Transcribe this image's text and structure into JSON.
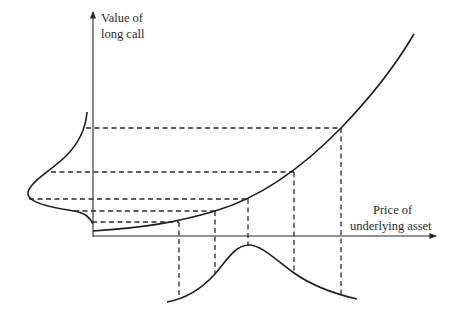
{
  "diagram": {
    "type": "option-payoff-distribution",
    "y_axis_label_line1": "Value of",
    "y_axis_label_line2": "long call",
    "x_axis_label_line1": "Price of",
    "x_axis_label_line2": "underlying asset",
    "elements": [
      "convex long call value curve",
      "bell-shaped distribution of underlying asset price below x-axis",
      "skewed distribution of long call value left of y-axis",
      "dashed mapping lines between curve points and both distributions"
    ],
    "mapped_points": [
      {
        "asset_price_px": 179,
        "call_value_px": 222
      },
      {
        "asset_price_px": 215,
        "call_value_px": 211
      },
      {
        "asset_price_px": 248,
        "call_value_px": 199
      },
      {
        "asset_price_px": 294,
        "call_value_px": 172
      },
      {
        "asset_price_px": 341,
        "call_value_px": 128
      }
    ],
    "colors": {
      "ink": "#1e1e1e",
      "background": "#ffffff"
    }
  }
}
